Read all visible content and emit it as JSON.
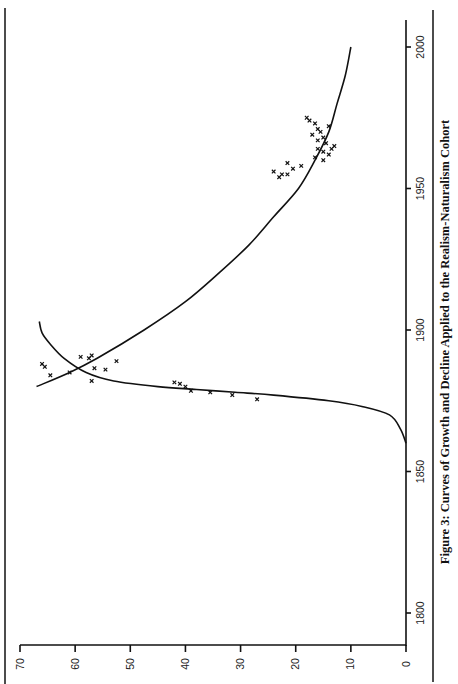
{
  "figure": {
    "caption": "Figure 3:  Curves of Growth and Decline Applied to the Realism-Naturalism Cohort",
    "orientation": "rotated-90-ccw"
  },
  "chart_data": {
    "type": "line",
    "title": "Figure 3: Curves of Growth and Decline Applied to the Realism-Naturalism Cohort",
    "xlabel": "",
    "ylabel": "",
    "xlim": [
      1790,
      2010
    ],
    "ylim": [
      0,
      70
    ],
    "x_ticks": [
      1800,
      1850,
      1900,
      1950,
      2000
    ],
    "y_ticks": [
      0,
      10,
      20,
      30,
      40,
      50,
      60,
      70
    ],
    "grid": false,
    "legend": null,
    "series": [
      {
        "name": "Growth curve",
        "kind": "line",
        "x": [
          1860,
          1865,
          1870,
          1873,
          1875,
          1877,
          1878,
          1879,
          1880,
          1882,
          1885,
          1890,
          1895,
          1899,
          1903
        ],
        "y": [
          0,
          1,
          3,
          8,
          14,
          24,
          31,
          38,
          45,
          53,
          58,
          62,
          64.5,
          66,
          66.5
        ]
      },
      {
        "name": "Decline curve",
        "kind": "line",
        "x": [
          1880,
          1885,
          1890,
          1900,
          1910,
          1920,
          1930,
          1940,
          1950,
          1960,
          1970,
          1980,
          1990,
          2000
        ],
        "y": [
          67,
          61,
          56,
          47.5,
          40,
          34,
          28.5,
          24,
          19.5,
          16.5,
          14,
          12.5,
          11,
          10
        ]
      },
      {
        "name": "Observed (growth phase)",
        "kind": "scatter",
        "x": [
          1875.5,
          1877,
          1878,
          1878.5,
          1880,
          1881,
          1881.5,
          1882,
          1885
        ],
        "y": [
          27,
          31.5,
          35.5,
          39,
          40,
          41,
          42,
          57,
          61
        ]
      },
      {
        "name": "Observed (peak)",
        "kind": "scatter",
        "x": [
          1884,
          1886,
          1886.5,
          1887,
          1888,
          1889,
          1890,
          1890.5,
          1891
        ],
        "y": [
          64.5,
          54.5,
          56.5,
          65.5,
          66,
          52.5,
          57.5,
          59,
          57
        ]
      },
      {
        "name": "Observed (decline phase)",
        "kind": "scatter",
        "x": [
          1954,
          1955,
          1955,
          1956,
          1957,
          1958,
          1959,
          1960,
          1961,
          1962,
          1963,
          1964,
          1964,
          1965,
          1966,
          1967,
          1968,
          1969,
          1970,
          1971,
          1972,
          1973,
          1974,
          1975
        ],
        "y": [
          23,
          21.5,
          22.5,
          24,
          20.5,
          19,
          21.5,
          15,
          16.5,
          14,
          15,
          16,
          13.5,
          13,
          14.5,
          16,
          15,
          17,
          15.5,
          16,
          14,
          16.5,
          17.5,
          18
        ]
      }
    ],
    "annotations": []
  }
}
